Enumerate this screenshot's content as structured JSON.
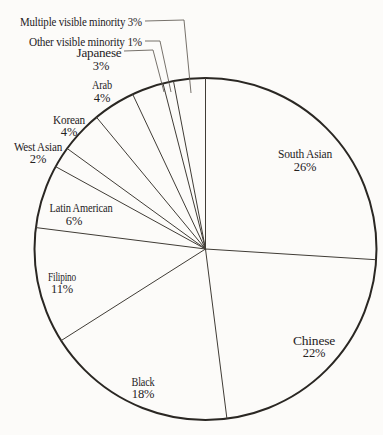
{
  "figure": {
    "background": "#fcfbf9",
    "outline_color": "#2a2723",
    "radial_line_color": "#403c36",
    "leader_line_color": "#5e5952",
    "text_color": "#25221e"
  },
  "chart_data": {
    "type": "pie",
    "title": "",
    "units": "%",
    "direction": "clockwise",
    "start_angle_deg": 0,
    "total": 100,
    "fill_style": "unfilled-outline-only",
    "slices": [
      {
        "label": "South Asian",
        "value": 26
      },
      {
        "label": "Chinese",
        "value": 22
      },
      {
        "label": "Black",
        "value": 18
      },
      {
        "label": "Filipino",
        "value": 11
      },
      {
        "label": "Latin American",
        "value": 6
      },
      {
        "label": "West Asian",
        "value": 2
      },
      {
        "label": "Korean",
        "value": 4
      },
      {
        "label": "Arab",
        "value": 4
      },
      {
        "label": "Japanese",
        "value": 3
      },
      {
        "label": "Other visible minority",
        "value": 1
      },
      {
        "label": "Multiple visible minority",
        "value": 3
      }
    ],
    "geometry": {
      "cx": 205.5,
      "cy": 249,
      "r": 171,
      "width": 383,
      "height": 435
    },
    "labels_layout": [
      {
        "slice": "South Asian",
        "lines": [
          "South Asian",
          "26%"
        ],
        "x": 305,
        "y": 158,
        "gap": 13,
        "anchor": "middle",
        "w": 54
      },
      {
        "slice": "Chinese",
        "lines": [
          "Chinese",
          "22%"
        ],
        "x": 314,
        "y": 345,
        "gap": 12,
        "anchor": "middle",
        "w": 42
      },
      {
        "slice": "Black",
        "lines": [
          "Black",
          "18%"
        ],
        "x": 143,
        "y": 386,
        "gap": 12,
        "anchor": "middle",
        "w": 23
      },
      {
        "slice": "Filipino",
        "lines": [
          "Filipino",
          "11%"
        ],
        "x": 62,
        "y": 281,
        "gap": 12,
        "anchor": "middle",
        "w": 28
      },
      {
        "slice": "Latin American",
        "lines": [
          "Latin American",
          "6%"
        ],
        "x": 81,
        "x2": 74,
        "y": 212,
        "gap": 13,
        "anchor": "middle",
        "w": 63
      },
      {
        "slice": "West Asian",
        "lines": [
          "West Asian",
          "2%"
        ],
        "x": 38,
        "y": 151,
        "gap": 12,
        "anchor": "middle",
        "w": 48
      },
      {
        "slice": "Korean",
        "lines": [
          "Korean",
          "4%"
        ],
        "x": 69,
        "y": 124,
        "gap": 12,
        "anchor": "middle",
        "w": 32
      },
      {
        "slice": "Arab",
        "lines": [
          "Arab",
          "4%"
        ],
        "x": 102,
        "y": 89,
        "gap": 13,
        "anchor": "middle",
        "w": 20
      },
      {
        "slice": "Japanese",
        "lines": [
          "Japanese",
          "3%"
        ],
        "x": 99,
        "x2": 101,
        "y": 57,
        "gap": 13,
        "anchor": "middle",
        "w": 45,
        "leader": [
          [
            124,
            51
          ],
          [
            153,
            50
          ],
          [
            164,
            92
          ]
        ]
      },
      {
        "slice": "Other visible minority",
        "lines": [
          "Other visible minority 1%"
        ],
        "x": 142,
        "y": 46,
        "anchor": "end",
        "w": 113,
        "leader": [
          [
            145,
            41
          ],
          [
            160,
            41
          ],
          [
            171,
            92
          ]
        ]
      },
      {
        "slice": "Multiple visible minority",
        "lines": [
          "Multiple visible minority 3%"
        ],
        "x": 142,
        "y": 26,
        "anchor": "end",
        "w": 122,
        "leader": [
          [
            145,
            21
          ],
          [
            184,
            20
          ],
          [
            191,
            93
          ]
        ]
      }
    ]
  }
}
